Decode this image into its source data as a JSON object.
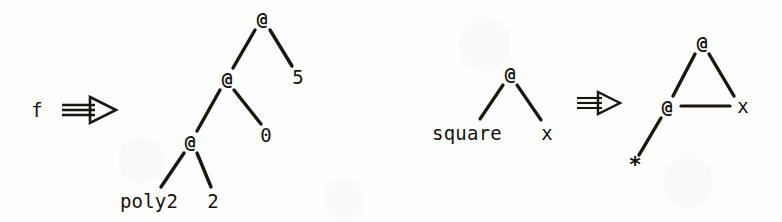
{
  "figure": {
    "background_color": "#fdfdfc",
    "ink_color": "#15130f",
    "width": 782,
    "height": 222
  },
  "diagrams": [
    {
      "id": "left-rewrite",
      "lhs": {
        "kind": "identifier",
        "label": "f"
      },
      "arrow": {
        "glyph": "double-arrow-right",
        "label": "rewrites-to"
      },
      "rhs": {
        "kind": "application-tree",
        "nodes": [
          {
            "id": "L0",
            "label": "@",
            "type": "application"
          },
          {
            "id": "L1",
            "label": "@",
            "type": "application"
          },
          {
            "id": "L2",
            "label": "@",
            "type": "application"
          },
          {
            "id": "L3",
            "label": "5",
            "type": "literal"
          },
          {
            "id": "L4",
            "label": "0",
            "type": "literal"
          },
          {
            "id": "L5",
            "label": "poly2",
            "type": "identifier"
          },
          {
            "id": "L6",
            "label": "2",
            "type": "literal"
          }
        ],
        "edges": [
          {
            "from": "L0",
            "to": "L1"
          },
          {
            "from": "L0",
            "to": "L3"
          },
          {
            "from": "L1",
            "to": "L2"
          },
          {
            "from": "L1",
            "to": "L4"
          },
          {
            "from": "L2",
            "to": "L5"
          },
          {
            "from": "L2",
            "to": "L6"
          }
        ]
      }
    },
    {
      "id": "right-rewrite",
      "lhs": {
        "kind": "application-tree",
        "nodes": [
          {
            "id": "R0",
            "label": "@",
            "type": "application"
          },
          {
            "id": "R1",
            "label": "square",
            "type": "identifier"
          },
          {
            "id": "R2",
            "label": "x",
            "type": "variable"
          }
        ],
        "edges": [
          {
            "from": "R0",
            "to": "R1"
          },
          {
            "from": "R0",
            "to": "R2"
          }
        ]
      },
      "arrow": {
        "glyph": "double-arrow-right",
        "label": "rewrites-to"
      },
      "rhs": {
        "kind": "application-graph",
        "nodes": [
          {
            "id": "S0",
            "label": "@",
            "type": "application"
          },
          {
            "id": "S1",
            "label": "@",
            "type": "application"
          },
          {
            "id": "S2",
            "label": "x",
            "type": "variable"
          },
          {
            "id": "S3",
            "label": "*",
            "type": "operator"
          }
        ],
        "edges": [
          {
            "from": "S0",
            "to": "S1"
          },
          {
            "from": "S0",
            "to": "S2"
          },
          {
            "from": "S1",
            "to": "S2"
          },
          {
            "from": "S1",
            "to": "S3"
          }
        ]
      }
    }
  ],
  "labels": {
    "left_root": "f",
    "left_at_root": "@",
    "left_at_mid": "@",
    "left_at_low": "@",
    "left_five": "5",
    "left_zero": "0",
    "left_poly2": "poly2",
    "left_two": "2",
    "right_at_top": "@",
    "right_square": "square",
    "right_x": "x",
    "graph_at_top": "@",
    "graph_at_left": "@",
    "graph_x": "x",
    "graph_star": "*"
  }
}
